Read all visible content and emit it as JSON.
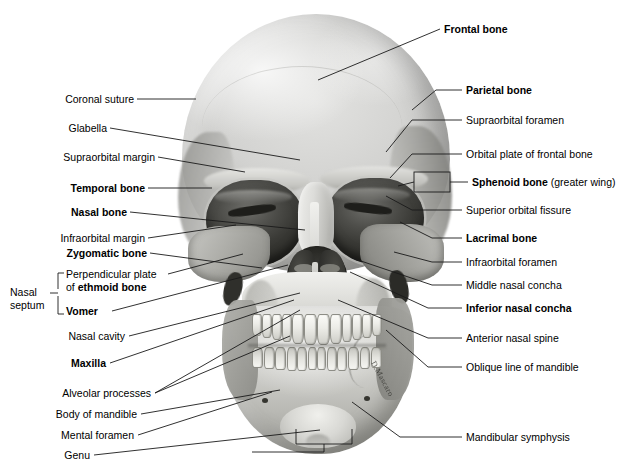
{
  "figure": {
    "view": "anterior",
    "style": "grayscale photograph with leader-line labels",
    "signature": "D.Mascaro"
  },
  "labels_left": [
    {
      "id": "coronal-suture",
      "text": "Coronal suture",
      "bold": false
    },
    {
      "id": "glabella",
      "text": "Glabella",
      "bold": false
    },
    {
      "id": "supraorbital-margin",
      "text": "Supraorbital margin",
      "bold": false
    },
    {
      "id": "temporal-bone",
      "text": "Temporal bone",
      "bold": true
    },
    {
      "id": "nasal-bone",
      "text": "Nasal bone",
      "bold": true
    },
    {
      "id": "infraorbital-margin",
      "text": "Infraorbital margin",
      "bold": false
    },
    {
      "id": "zygomatic-bone",
      "text": "Zygomatic bone",
      "bold": true
    },
    {
      "id": "nasal-cavity",
      "text": "Nasal cavity",
      "bold": false
    },
    {
      "id": "maxilla",
      "text": "Maxilla",
      "bold": true
    },
    {
      "id": "alveolar-processes",
      "text": "Alveolar processes",
      "bold": false
    },
    {
      "id": "body-of-mandible",
      "text": "Body of mandible",
      "bold": false
    },
    {
      "id": "mental-foramen",
      "text": "Mental foramen",
      "bold": false
    },
    {
      "id": "genu",
      "text": "Genu",
      "bold": false
    }
  ],
  "nasal_septum_group": {
    "bracket_label_line1": "Nasal",
    "bracket_label_line2": "septum",
    "items": [
      {
        "id": "perpendicular-plate",
        "line1": "Perpendicular plate",
        "line2_prefix": "of ",
        "line2_bold": "ethmoid bone"
      },
      {
        "id": "vomer",
        "text": "Vomer",
        "bold": true
      }
    ]
  },
  "labels_right": [
    {
      "id": "frontal-bone",
      "text": "Frontal bone",
      "bold": true,
      "suffix": ""
    },
    {
      "id": "parietal-bone",
      "text": "Parietal bone",
      "bold": true,
      "suffix": ""
    },
    {
      "id": "supraorbital-foramen",
      "text": "Supraorbital foramen",
      "bold": false,
      "suffix": ""
    },
    {
      "id": "orbital-plate",
      "text": "Orbital plate of frontal bone",
      "bold": false,
      "suffix": ""
    },
    {
      "id": "sphenoid-bone",
      "text": "Sphenoid bone",
      "bold": true,
      "suffix": " (greater wing)"
    },
    {
      "id": "superior-orbital-fissure",
      "text": "Superior orbital fissure",
      "bold": false,
      "suffix": ""
    },
    {
      "id": "lacrimal-bone",
      "text": "Lacrimal bone",
      "bold": true,
      "suffix": ""
    },
    {
      "id": "infraorbital-foramen",
      "text": "Infraorbital foramen",
      "bold": false,
      "suffix": ""
    },
    {
      "id": "middle-nasal-concha",
      "text": "Middle nasal concha",
      "bold": false,
      "suffix": ""
    },
    {
      "id": "inferior-nasal-concha",
      "text": "Inferior nasal concha",
      "bold": true,
      "suffix": ""
    },
    {
      "id": "anterior-nasal-spine",
      "text": "Anterior nasal spine",
      "bold": false,
      "suffix": ""
    },
    {
      "id": "oblique-line",
      "text": "Oblique line of mandible",
      "bold": false,
      "suffix": ""
    },
    {
      "id": "mandibular-symphysis",
      "text": "Mandibular symphysis",
      "bold": false,
      "suffix": ""
    }
  ],
  "colors": {
    "ink": "#000000",
    "leader_line": "#1a1a1a",
    "background": "#ffffff",
    "bone_light": "#e2e2e0",
    "bone_mid": "#b8b8b3",
    "bone_dark": "#8a8a85",
    "orbit_dark": "#3a3a36"
  }
}
